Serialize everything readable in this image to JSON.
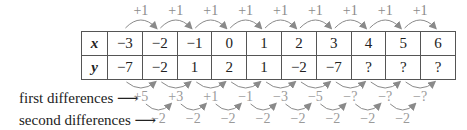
{
  "step_label": "+1",
  "table": {
    "x_header": "x",
    "y_header": "y",
    "x_values": [
      "−3",
      "−2",
      "−1",
      "0",
      "1",
      "2",
      "3",
      "4",
      "5",
      "6"
    ],
    "y_values": [
      "−7",
      "−2",
      "1",
      "2",
      "1",
      "−2",
      "−7",
      "?",
      "?",
      "?"
    ]
  },
  "first_differences": {
    "label": "first differences",
    "values": [
      "+5",
      "+3",
      "+1",
      "−1",
      "−3",
      "−5",
      "−?",
      "−?",
      "−?"
    ]
  },
  "second_differences": {
    "label": "second differences",
    "values": [
      "−2",
      "−2",
      "−2",
      "−2",
      "−2",
      "−2",
      "−2",
      "−2"
    ]
  },
  "colors": {
    "text": "#222222",
    "border": "#555555",
    "arrow": "#8a8a8a",
    "difference_text": "#9a9a9a"
  }
}
